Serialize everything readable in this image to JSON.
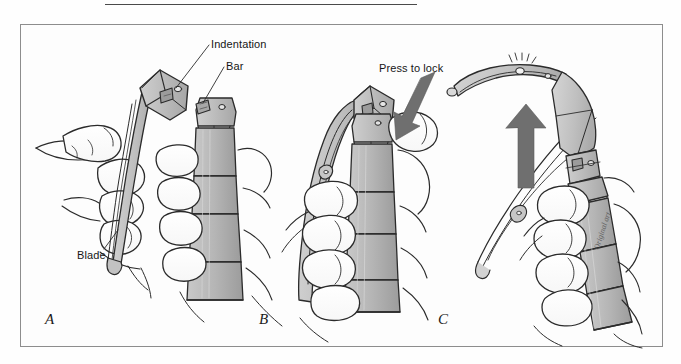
{
  "figure": {
    "frame": {
      "x": 20,
      "y": 24,
      "width": 643,
      "height": 323
    },
    "top_rule": {
      "x": 105,
      "y": 4,
      "width": 312
    }
  },
  "labels": {
    "indentation": "Indentation",
    "bar": "Bar",
    "blade": "Blade",
    "press_to_lock": "Press to lock"
  },
  "panels": [
    {
      "letter": "A",
      "caption": "Blade held beside handle; indentation on blade base and bar on handle top are identified."
    },
    {
      "letter": "B",
      "caption": "Blade indentation seated over handle bar; downward pressure applied to lock."
    },
    {
      "letter": "C",
      "caption": "Blade snapped upward into the open, locked position with light on."
    }
  ],
  "arrows": [
    {
      "name": "press-to-lock-arrow",
      "direction": "down-left",
      "panel": "B"
    },
    {
      "name": "open-blade-arrow",
      "direction": "up",
      "panel": "C"
    }
  ],
  "signature": "Original art",
  "colors": {
    "ink": "#161616",
    "outline": "#2b2b2b",
    "metal_light": "#d4d4d4",
    "metal_mid": "#bcbcbc",
    "metal_dark": "#9e9e9e",
    "arrow_gray": "#6f6f6f",
    "frame": "#8d8d8d",
    "paper": "#fdfdfd"
  }
}
